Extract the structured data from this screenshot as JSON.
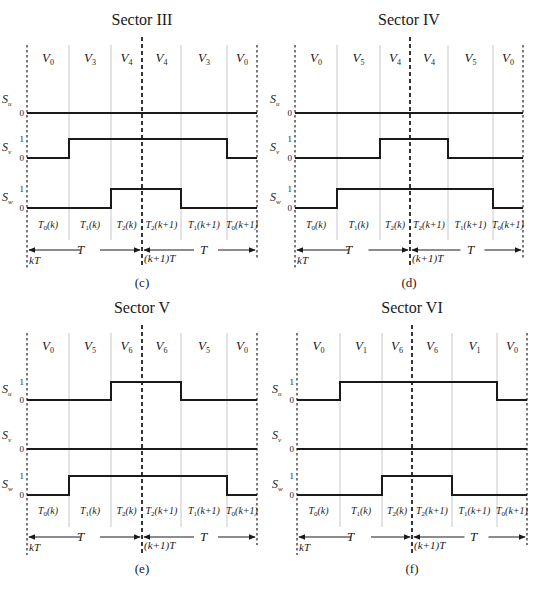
{
  "figure": {
    "panels": [
      {
        "id": "c",
        "title": "Sector III",
        "caption": "(c)",
        "vectors": [
          {
            "base": "V",
            "sub": "0"
          },
          {
            "base": "V",
            "sub": "3"
          },
          {
            "base": "V",
            "sub": "4"
          },
          {
            "base": "V",
            "sub": "4"
          },
          {
            "base": "V",
            "sub": "3"
          },
          {
            "base": "V",
            "sub": "0"
          }
        ],
        "signals": [
          {
            "name": "S",
            "sub": "u",
            "levels_shown": [
              "0"
            ],
            "pattern": [
              0,
              0,
              0,
              0,
              0,
              0
            ]
          },
          {
            "name": "S",
            "sub": "v",
            "levels_shown": [
              "1",
              "0"
            ],
            "pattern": [
              0,
              1,
              1,
              1,
              1,
              0
            ]
          },
          {
            "name": "S",
            "sub": "w",
            "levels_shown": [
              "1",
              "0"
            ],
            "pattern": [
              0,
              0,
              1,
              1,
              0,
              0
            ]
          }
        ],
        "intervals": [
          "T0(k)",
          "T1(k)",
          "T2(k)",
          "T2(k+1)",
          "T1(k+1)",
          "T0(k+1)"
        ],
        "period_labels": [
          "T",
          "T"
        ],
        "time_marks": [
          "kT",
          "(k+1)T"
        ]
      },
      {
        "id": "d",
        "title": "Sector IV",
        "caption": "(d)",
        "vectors": [
          {
            "base": "V",
            "sub": "0"
          },
          {
            "base": "V",
            "sub": "5"
          },
          {
            "base": "V",
            "sub": "4"
          },
          {
            "base": "V",
            "sub": "4"
          },
          {
            "base": "V",
            "sub": "5"
          },
          {
            "base": "V",
            "sub": "0"
          }
        ],
        "signals": [
          {
            "name": "S",
            "sub": "u",
            "levels_shown": [
              "0"
            ],
            "pattern": [
              0,
              0,
              0,
              0,
              0,
              0
            ]
          },
          {
            "name": "S",
            "sub": "v",
            "levels_shown": [
              "1",
              "0"
            ],
            "pattern": [
              0,
              0,
              1,
              1,
              0,
              0
            ]
          },
          {
            "name": "S",
            "sub": "w",
            "levels_shown": [
              "1",
              "0"
            ],
            "pattern": [
              0,
              1,
              1,
              1,
              1,
              0
            ]
          }
        ],
        "intervals": [
          "T0(k)",
          "T1(k)",
          "T2(k)",
          "T2(k+1)",
          "T1(k+1)",
          "T0(k+1)"
        ],
        "period_labels": [
          "T",
          "T"
        ],
        "time_marks": [
          "kT",
          "(k+1)T"
        ]
      },
      {
        "id": "e",
        "title": "Sector V",
        "caption": "(e)",
        "vectors": [
          {
            "base": "V",
            "sub": "0"
          },
          {
            "base": "V",
            "sub": "5"
          },
          {
            "base": "V",
            "sub": "6"
          },
          {
            "base": "V",
            "sub": "6"
          },
          {
            "base": "V",
            "sub": "5"
          },
          {
            "base": "V",
            "sub": "0"
          }
        ],
        "signals": [
          {
            "name": "S",
            "sub": "u",
            "levels_shown": [
              "1",
              "0"
            ],
            "pattern": [
              0,
              0,
              1,
              1,
              0,
              0
            ]
          },
          {
            "name": "S",
            "sub": "v",
            "levels_shown": [
              "0"
            ],
            "pattern": [
              0,
              0,
              0,
              0,
              0,
              0
            ]
          },
          {
            "name": "S",
            "sub": "w",
            "levels_shown": [
              "1",
              "0"
            ],
            "pattern": [
              0,
              1,
              1,
              1,
              1,
              0
            ]
          }
        ],
        "intervals": [
          "T0(k)",
          "T1(k)",
          "T2(k)",
          "T2(k+1)",
          "T1(k+1)",
          "T0(k+1)"
        ],
        "period_labels": [
          "T",
          "T"
        ],
        "time_marks": [
          "kT",
          "(k+1)T"
        ]
      },
      {
        "id": "f",
        "title": "Sector VI",
        "caption": "(f)",
        "vectors": [
          {
            "base": "V",
            "sub": "0"
          },
          {
            "base": "V",
            "sub": "1"
          },
          {
            "base": "V",
            "sub": "6"
          },
          {
            "base": "V",
            "sub": "6"
          },
          {
            "base": "V",
            "sub": "1"
          },
          {
            "base": "V",
            "sub": "0"
          }
        ],
        "signals": [
          {
            "name": "S",
            "sub": "u",
            "levels_shown": [
              "1",
              "0"
            ],
            "pattern": [
              0,
              1,
              1,
              1,
              1,
              0
            ]
          },
          {
            "name": "S",
            "sub": "v",
            "levels_shown": [
              "0"
            ],
            "pattern": [
              0,
              0,
              0,
              0,
              0,
              0
            ]
          },
          {
            "name": "S",
            "sub": "w",
            "levels_shown": [
              "1",
              "0"
            ],
            "pattern": [
              0,
              0,
              1,
              1,
              0,
              0
            ]
          }
        ],
        "intervals": [
          "T0(k)",
          "T1(k)",
          "T2(k)",
          "T2(k+1)",
          "T1(k+1)",
          "T0(k+1)"
        ],
        "period_labels": [
          "T",
          "T"
        ],
        "time_marks": [
          "kT",
          "(k+1)T"
        ]
      }
    ]
  },
  "labels": {
    "c_title": "Sector III",
    "d_title": "Sector IV",
    "e_title": "Sector V",
    "f_title": "Sector VI",
    "c_caption": "(c)",
    "d_caption": "(d)",
    "e_caption": "(e)",
    "f_caption": "(f)",
    "V": "V",
    "S": "S",
    "T": "T",
    "kT": "kT",
    "k1T": "(k+1)T",
    "one": "1",
    "zero": "0",
    "sub_u": "u",
    "sub_v": "v",
    "sub_w": "w",
    "t_k": "(k)",
    "t_k1": "(k+1)",
    "n0": "0",
    "n1": "1",
    "n2": "2",
    "n3": "3",
    "n4": "4",
    "n5": "5",
    "n6": "6"
  }
}
